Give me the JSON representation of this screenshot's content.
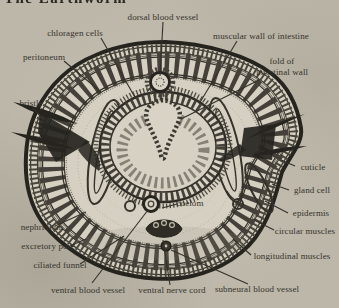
{
  "page": {
    "heading_fragment": "The Earthworm",
    "colors": {
      "paper": "#bcb7a9",
      "ink": "#2e2b26",
      "label_text": "#35322a"
    }
  },
  "figure": {
    "kind": "labeled-anatomical-cross-section",
    "labels": {
      "dorsal_blood_vessel": "dorsal blood vessel",
      "chloragen_cells": "chloragen cells",
      "muscular_wall_of_intestine": "muscular wall of intestine",
      "peritoneum": "peritoneum",
      "fold_of": "fold of",
      "intestinal_wall": "intestinal wall",
      "bristle": "bristle",
      "cuticle": "cuticle",
      "gland_cell": "gland cell",
      "epidermis": "epidermis",
      "circular_muscles": "circular muscles",
      "longitudinal_muscles": "longitudinal muscles",
      "nephridium": "nephridium",
      "excretory_pore": "excretory pore",
      "ciliated_funnel": "ciliated funnel",
      "ventral_blood_vessel": "ventral blood vessel",
      "ventral_nerve_cord": "ventral nerve cord",
      "subneural_blood_vessel": "subneural blood vessel",
      "coelom": "coelom"
    }
  }
}
